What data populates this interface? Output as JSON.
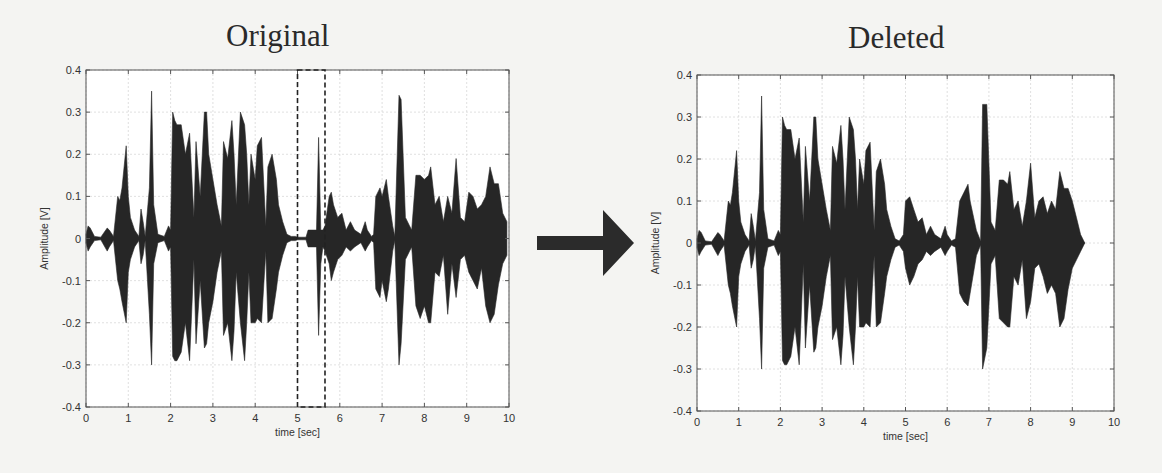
{
  "figure": {
    "arrow": {
      "direction": "right",
      "color": "#2b2b2b"
    },
    "colors": {
      "waveform": "#262626",
      "axes": "#555555",
      "grid": "#d8d8d8",
      "selection_box": "#222222",
      "background": "#f4f4f2"
    }
  },
  "panels": [
    {
      "id": "original",
      "title": "Original",
      "xlabel": "time [sec]",
      "ylabel": "Amplitude [V]",
      "xticks": [
        "0",
        "1",
        "2",
        "3",
        "4",
        "5",
        "6",
        "7",
        "8",
        "9",
        "10"
      ],
      "yticks": [
        "0.4",
        "0.3",
        "0.2",
        "0.1",
        "0",
        "-0.1",
        "-0.2",
        "-0.3",
        "-0.4"
      ],
      "selection": {
        "label": "deleted segment",
        "x_start": 5.0,
        "x_end": 5.65,
        "style": "dashed"
      }
    },
    {
      "id": "deleted",
      "title": "Deleted",
      "xlabel": "time [sec]",
      "ylabel": "Amplitude [V]",
      "xticks": [
        "0",
        "1",
        "2",
        "3",
        "4",
        "5",
        "6",
        "7",
        "8",
        "9",
        "10"
      ],
      "yticks": [
        "0.4",
        "0.3",
        "0.2",
        "0.1",
        "0",
        "-0.1",
        "-0.2",
        "-0.3",
        "-0.4"
      ]
    }
  ],
  "chart_data": [
    {
      "type": "area",
      "title": "Original",
      "xlabel": "time [sec]",
      "ylabel": "Amplitude [V]",
      "xlim": [
        0,
        10
      ],
      "ylim": [
        -0.4,
        0.4
      ],
      "grid": true,
      "annotation": {
        "type": "dashed-rectangle",
        "x": [
          5.0,
          5.65
        ],
        "y": [
          -0.4,
          0.4
        ]
      },
      "series": [
        {
          "name": "waveform envelope",
          "x": [
            0,
            0.05,
            0.1,
            0.2,
            0.35,
            0.5,
            0.55,
            0.65,
            0.75,
            0.8,
            0.85,
            0.95,
            1.0,
            1.05,
            1.15,
            1.25,
            1.3,
            1.35,
            1.4,
            1.5,
            1.55,
            1.6,
            1.7,
            1.85,
            1.95,
            2.0,
            2.05,
            2.1,
            2.15,
            2.25,
            2.35,
            2.45,
            2.55,
            2.6,
            2.7,
            2.8,
            2.85,
            2.9,
            3.0,
            3.1,
            3.2,
            3.25,
            3.35,
            3.45,
            3.5,
            3.55,
            3.65,
            3.75,
            3.8,
            3.85,
            3.9,
            4.0,
            4.05,
            4.15,
            4.25,
            4.3,
            4.4,
            4.5,
            4.55,
            4.65,
            4.75,
            4.85,
            4.95,
            5.0,
            5.1,
            5.2,
            5.25,
            5.35,
            5.45,
            5.5,
            5.55,
            5.6,
            5.65,
            5.75,
            5.8,
            5.85,
            5.95,
            6.05,
            6.15,
            6.25,
            6.35,
            6.5,
            6.6,
            6.65,
            6.75,
            6.8,
            6.85,
            6.95,
            7.0,
            7.1,
            7.15,
            7.25,
            7.3,
            7.4,
            7.45,
            7.55,
            7.65,
            7.7,
            7.8,
            7.9,
            8.0,
            8.1,
            8.15,
            8.25,
            8.35,
            8.45,
            8.55,
            8.65,
            8.75,
            8.85,
            8.95,
            9.05,
            9.15,
            9.25,
            9.35,
            9.45,
            9.55,
            9.65,
            9.75,
            9.85,
            9.95
          ],
          "upper": [
            0.01,
            0.03,
            0.025,
            0.005,
            0.003,
            0.025,
            0.02,
            0.005,
            0.1,
            0.09,
            0.12,
            0.22,
            0.1,
            0.05,
            0.02,
            0.005,
            0.07,
            0.04,
            0.005,
            0.12,
            0.35,
            0.08,
            0.01,
            0.005,
            0.03,
            0.02,
            0.3,
            0.28,
            0.27,
            0.27,
            0.2,
            0.25,
            0.05,
            0.23,
            0.1,
            0.3,
            0.3,
            0.2,
            0.14,
            0.08,
            0.03,
            0.23,
            0.19,
            0.28,
            0.2,
            0.08,
            0.3,
            0.27,
            0.2,
            0.08,
            0.2,
            0.14,
            0.22,
            0.24,
            0.03,
            0.17,
            0.2,
            0.14,
            0.08,
            0.04,
            0.01,
            0.005,
            0.005,
            0.003,
            0.003,
            0.003,
            0.02,
            0.02,
            0.02,
            0.24,
            0.02,
            0.02,
            0.03,
            0.1,
            0.11,
            0.08,
            0.05,
            0.06,
            0.02,
            0.04,
            0.02,
            0.01,
            0.04,
            0.02,
            0.005,
            0.01,
            0.1,
            0.12,
            0.1,
            0.14,
            0.1,
            0.03,
            0.005,
            0.34,
            0.33,
            0.05,
            0.03,
            0.02,
            0.15,
            0.15,
            0.14,
            0.15,
            0.17,
            0.08,
            0.1,
            0.04,
            0.1,
            0.06,
            0.19,
            0.05,
            0.04,
            0.11,
            0.1,
            0.07,
            0.08,
            0.1,
            0.17,
            0.13,
            0.13,
            0.06,
            0.04
          ],
          "lower": [
            -0.01,
            -0.03,
            -0.02,
            -0.005,
            -0.003,
            -0.03,
            -0.02,
            -0.005,
            -0.1,
            -0.12,
            -0.15,
            -0.2,
            -0.08,
            -0.05,
            -0.02,
            -0.005,
            -0.06,
            -0.04,
            -0.005,
            -0.18,
            -0.3,
            -0.06,
            -0.01,
            -0.005,
            -0.03,
            -0.02,
            -0.28,
            -0.29,
            -0.29,
            -0.27,
            -0.2,
            -0.29,
            -0.05,
            -0.25,
            -0.1,
            -0.26,
            -0.25,
            -0.2,
            -0.15,
            -0.08,
            -0.03,
            -0.23,
            -0.2,
            -0.29,
            -0.22,
            -0.08,
            -0.2,
            -0.29,
            -0.2,
            -0.08,
            -0.2,
            -0.2,
            -0.19,
            -0.2,
            -0.03,
            -0.2,
            -0.19,
            -0.12,
            -0.08,
            -0.04,
            -0.01,
            -0.005,
            -0.005,
            -0.003,
            -0.003,
            -0.003,
            -0.02,
            -0.02,
            -0.02,
            -0.23,
            -0.06,
            -0.02,
            -0.03,
            -0.06,
            -0.1,
            -0.08,
            -0.05,
            -0.04,
            -0.02,
            -0.03,
            -0.02,
            -0.01,
            -0.03,
            -0.02,
            -0.005,
            -0.01,
            -0.12,
            -0.14,
            -0.1,
            -0.15,
            -0.12,
            -0.03,
            -0.005,
            -0.3,
            -0.25,
            -0.05,
            -0.03,
            -0.02,
            -0.16,
            -0.19,
            -0.16,
            -0.2,
            -0.2,
            -0.08,
            -0.09,
            -0.04,
            -0.18,
            -0.06,
            -0.14,
            -0.05,
            -0.04,
            -0.08,
            -0.1,
            -0.12,
            -0.07,
            -0.16,
            -0.2,
            -0.18,
            -0.11,
            -0.06,
            -0.04
          ]
        }
      ]
    },
    {
      "type": "area",
      "title": "Deleted",
      "xlabel": "time [sec]",
      "ylabel": "Amplitude [V]",
      "xlim": [
        0,
        10
      ],
      "ylim": [
        -0.4,
        0.4
      ],
      "grid": true,
      "series": [
        {
          "name": "waveform envelope",
          "x": [
            0,
            0.05,
            0.1,
            0.2,
            0.35,
            0.5,
            0.55,
            0.65,
            0.75,
            0.8,
            0.85,
            0.95,
            1.0,
            1.05,
            1.15,
            1.25,
            1.3,
            1.35,
            1.4,
            1.5,
            1.55,
            1.6,
            1.7,
            1.85,
            1.95,
            2.0,
            2.05,
            2.1,
            2.15,
            2.25,
            2.35,
            2.45,
            2.55,
            2.6,
            2.7,
            2.8,
            2.85,
            2.9,
            3.0,
            3.1,
            3.2,
            3.25,
            3.35,
            3.45,
            3.5,
            3.55,
            3.65,
            3.75,
            3.8,
            3.85,
            3.9,
            4.0,
            4.05,
            4.15,
            4.25,
            4.3,
            4.4,
            4.5,
            4.55,
            4.65,
            4.75,
            4.85,
            4.95,
            5.0,
            5.1,
            5.2,
            5.3,
            5.4,
            5.5,
            5.6,
            5.7,
            5.85,
            5.95,
            6.0,
            6.1,
            6.2,
            6.3,
            6.4,
            6.5,
            6.55,
            6.7,
            6.8,
            6.85,
            6.95,
            7.05,
            7.15,
            7.25,
            7.35,
            7.45,
            7.5,
            7.6,
            7.7,
            7.8,
            7.9,
            8.0,
            8.1,
            8.2,
            8.3,
            8.4,
            8.5,
            8.6,
            8.7,
            8.8,
            8.9,
            9.0,
            9.1,
            9.2,
            9.3
          ],
          "upper": [
            0.01,
            0.03,
            0.025,
            0.005,
            0.003,
            0.025,
            0.02,
            0.005,
            0.1,
            0.09,
            0.12,
            0.22,
            0.1,
            0.05,
            0.02,
            0.005,
            0.07,
            0.04,
            0.005,
            0.12,
            0.35,
            0.08,
            0.01,
            0.005,
            0.03,
            0.02,
            0.3,
            0.28,
            0.27,
            0.27,
            0.2,
            0.25,
            0.05,
            0.23,
            0.1,
            0.3,
            0.3,
            0.2,
            0.14,
            0.08,
            0.03,
            0.23,
            0.19,
            0.28,
            0.2,
            0.08,
            0.3,
            0.27,
            0.2,
            0.08,
            0.2,
            0.14,
            0.22,
            0.24,
            0.03,
            0.17,
            0.2,
            0.14,
            0.08,
            0.04,
            0.01,
            0.005,
            0.02,
            0.1,
            0.11,
            0.08,
            0.05,
            0.06,
            0.02,
            0.04,
            0.02,
            0.01,
            0.04,
            0.02,
            0.005,
            0.01,
            0.1,
            0.12,
            0.14,
            0.1,
            0.03,
            0.005,
            0.33,
            0.33,
            0.05,
            0.03,
            0.15,
            0.15,
            0.14,
            0.17,
            0.08,
            0.1,
            0.04,
            0.1,
            0.19,
            0.06,
            0.1,
            0.11,
            0.07,
            0.1,
            0.08,
            0.17,
            0.13,
            0.13,
            0.1,
            0.06,
            0.02,
            0.0
          ],
          "lower": [
            -0.01,
            -0.03,
            -0.02,
            -0.005,
            -0.003,
            -0.03,
            -0.02,
            -0.005,
            -0.1,
            -0.12,
            -0.15,
            -0.2,
            -0.08,
            -0.05,
            -0.02,
            -0.005,
            -0.06,
            -0.04,
            -0.005,
            -0.18,
            -0.3,
            -0.06,
            -0.01,
            -0.005,
            -0.03,
            -0.02,
            -0.28,
            -0.29,
            -0.29,
            -0.27,
            -0.2,
            -0.29,
            -0.05,
            -0.25,
            -0.1,
            -0.26,
            -0.25,
            -0.2,
            -0.15,
            -0.08,
            -0.03,
            -0.23,
            -0.2,
            -0.29,
            -0.22,
            -0.08,
            -0.2,
            -0.29,
            -0.2,
            -0.08,
            -0.2,
            -0.2,
            -0.19,
            -0.2,
            -0.03,
            -0.2,
            -0.19,
            -0.12,
            -0.08,
            -0.04,
            -0.01,
            -0.005,
            -0.02,
            -0.06,
            -0.1,
            -0.08,
            -0.05,
            -0.04,
            -0.02,
            -0.03,
            -0.02,
            -0.01,
            -0.03,
            -0.02,
            -0.005,
            -0.01,
            -0.12,
            -0.14,
            -0.15,
            -0.12,
            -0.03,
            -0.005,
            -0.3,
            -0.25,
            -0.05,
            -0.03,
            -0.18,
            -0.19,
            -0.2,
            -0.2,
            -0.08,
            -0.1,
            -0.04,
            -0.18,
            -0.14,
            -0.06,
            -0.05,
            -0.08,
            -0.12,
            -0.1,
            -0.12,
            -0.2,
            -0.18,
            -0.11,
            -0.06,
            -0.04,
            -0.02,
            0.0
          ]
        }
      ]
    }
  ]
}
